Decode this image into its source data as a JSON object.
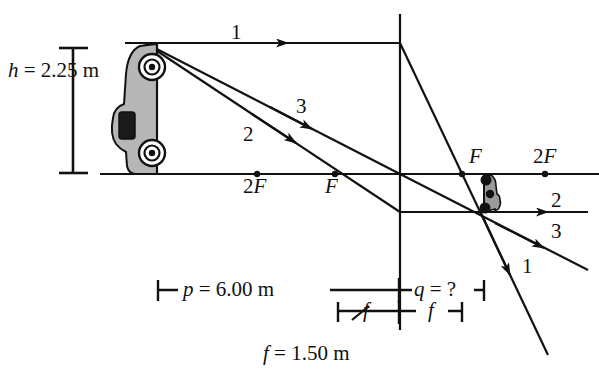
{
  "figure": {
    "colors": {
      "ink": "#111111",
      "object_fill": "#b0b0b0",
      "image_fill": "#9a9a9a",
      "background": "#ffffff"
    },
    "object_height_label": "h = 2.25 m",
    "object_distance_label": "p = 6.00 m",
    "image_distance_label": "q = ?",
    "focal_label_short": "f",
    "focal_value_label": "f = 1.50 m",
    "ray_labels_left": [
      "1",
      "2",
      "3"
    ],
    "ray_labels_right": [
      "2",
      "3",
      "1"
    ],
    "focal_point_labels": [
      "2F",
      "F",
      "F",
      "2F"
    ]
  },
  "chart_data": {
    "type": "diagram",
    "quantities": [
      {
        "symbol": "h",
        "value": 2.25,
        "unit": "m",
        "label": "h = 2.25 m",
        "meaning": "object height"
      },
      {
        "symbol": "p",
        "value": 6.0,
        "unit": "m",
        "label": "p = 6.00 m",
        "meaning": "object distance"
      },
      {
        "symbol": "q",
        "value": null,
        "unit": "m",
        "label": "q = ?",
        "meaning": "image distance (unknown)"
      },
      {
        "symbol": "f",
        "value": 1.5,
        "unit": "m",
        "label": "f = 1.50 m",
        "meaning": "focal length"
      }
    ],
    "axis_markers": [
      {
        "label": "2F",
        "side": "left",
        "x_px": 257
      },
      {
        "label": "F",
        "side": "left",
        "x_px": 335
      },
      {
        "label": "F",
        "side": "right",
        "x_px": 462
      },
      {
        "label": "2F",
        "side": "right",
        "x_px": 545
      }
    ],
    "rays": [
      {
        "id": "1",
        "description": "parallel to axis from object top, refracts through far focal point F"
      },
      {
        "id": "2",
        "description": "through lens center, undeviated"
      },
      {
        "id": "3",
        "description": "through near focal point F, exits parallel to axis"
      }
    ],
    "lens": {
      "x_px": 400,
      "axis_y_px": 174
    },
    "object": {
      "top_y_px": 43,
      "bottom_y_px": 174,
      "x_px": 145,
      "orientation": "upright"
    },
    "image": {
      "top_y_px": 174,
      "bottom_y_px": 212,
      "x_px": 487,
      "orientation": "inverted"
    }
  }
}
